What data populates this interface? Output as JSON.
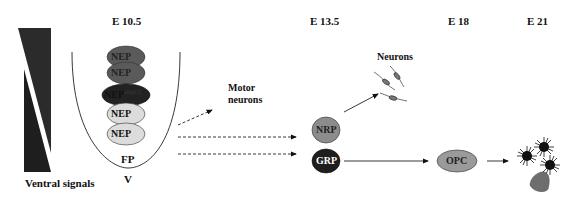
{
  "stages": {
    "e10_5": "E 10.5",
    "e13_5": "E 13.5",
    "e18": "E 18",
    "e21": "E 21"
  },
  "ventral_signals_label": "Ventral signals",
  "neural_tube": {
    "floor_plate": "FP",
    "ventral": "V",
    "cells": [
      {
        "label": "NEP",
        "sup": "",
        "fill": "#5a5a5a"
      },
      {
        "label": "NEP",
        "sup": "",
        "fill": "#5a5a5a"
      },
      {
        "label": "NEP",
        "sup": "olig1/2",
        "fill": "#222222"
      },
      {
        "label": "NEP",
        "sup": "",
        "fill": "#dcdcdc"
      },
      {
        "label": "NEP",
        "sup": "",
        "fill": "#dcdcdc"
      }
    ]
  },
  "motor_neurons_label_1": "Motor",
  "motor_neurons_label_2": "neurons",
  "neurons_label": "Neurons",
  "nrp": {
    "label": "NRP",
    "fill": "#8c8c8c"
  },
  "grp": {
    "label": "GRP",
    "fill": "#1e1e1e"
  },
  "opc": {
    "label": "OPC",
    "fill": "#9a9a9a"
  }
}
